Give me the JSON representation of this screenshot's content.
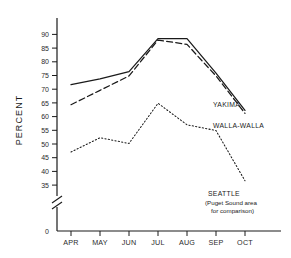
{
  "chart_data": {
    "type": "line",
    "title": "",
    "xlabel": "",
    "ylabel": "PERCENT",
    "categories": [
      "APR",
      "MAY",
      "JUN",
      "JUL",
      "AUG",
      "SEP",
      "OCT"
    ],
    "ylim": [
      35,
      92
    ],
    "y_axis_break": true,
    "y_zero_tick": "0",
    "yticks": [
      35,
      40,
      45,
      50,
      55,
      60,
      65,
      70,
      75,
      80,
      85,
      90
    ],
    "ytick_labels": [
      "35",
      "40",
      "45",
      "50",
      "55",
      "60",
      "65",
      "70",
      "75",
      "80",
      "85",
      "90"
    ],
    "grid": false,
    "legend_position": "inline-right",
    "series": [
      {
        "name": "YAKIMA",
        "label": "YAKIMA",
        "style": "solid",
        "color": "#1a1a1a",
        "values": [
          70,
          72,
          74.5,
          86,
          86,
          74,
          61
        ]
      },
      {
        "name": "WALLA-WALLA",
        "label": "WALLA-WALLA",
        "style": "dashed",
        "color": "#1a1a1a",
        "values": [
          63,
          68,
          73,
          85.5,
          84,
          73,
          60
        ]
      },
      {
        "name": "SEATTLE",
        "label": "SEATTLE",
        "style": "dotted",
        "color": "#1a1a1a",
        "values": [
          46.5,
          51.5,
          49.5,
          63.5,
          56,
          54,
          36.5
        ]
      }
    ],
    "annotations": [
      {
        "name": "seattle-note-line1",
        "text": "(Puget Sound area"
      },
      {
        "name": "seattle-note-line2",
        "text": "for comparison)"
      }
    ]
  }
}
